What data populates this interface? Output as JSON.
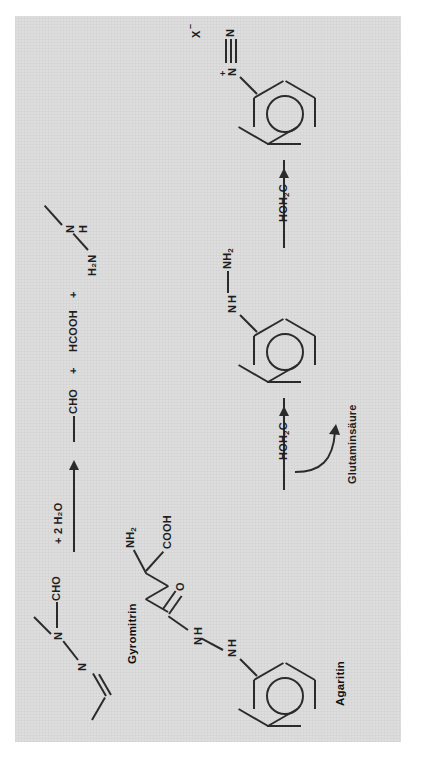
{
  "figure": {
    "type": "chemical-reaction-scheme",
    "language": "de",
    "background_color": "#dcdcdc",
    "ink_color": "#2b2b2b"
  },
  "reaction_a": {
    "reactant_name": "Gyromitrin",
    "reactant_labels": {
      "aldehyde": "CHO",
      "nitrogen_1": "N",
      "nitrogen_2": "N"
    },
    "arrow_label": "+ 2 H₂O",
    "products": [
      {
        "label": "CHO"
      },
      {
        "plus": "+"
      },
      {
        "label": "HCOOH"
      },
      {
        "plus": "+"
      },
      {
        "label_left": "H₂N",
        "label_n": "N",
        "label_h": "H"
      }
    ]
  },
  "reaction_b": {
    "reactant_name": "Agaritin",
    "reactant_labels": {
      "amine": "NH₂",
      "acid": "COOH",
      "carbonyl_o": "O",
      "hydrazide_n1": "N",
      "hydrazide_h1": "H",
      "hydrazide_n2": "N",
      "hydrazide_h2": "H",
      "ring_substituent": "HOH₂C"
    },
    "step1_arrow_side_label": "Glutaminsäure",
    "intermediate_labels": {
      "hydrazine_n": "N",
      "hydrazine_h": "H",
      "hydrazine_nh2": "NH₂",
      "ring_substituent": "HOH₂C"
    },
    "product_labels": {
      "diazo_n_top": "N",
      "diazo_n_bottom": "N",
      "diazo_charge": "+",
      "counter_ion": "X",
      "counter_ion_charge": "–",
      "ring_substituent": "HOH₂C"
    }
  }
}
